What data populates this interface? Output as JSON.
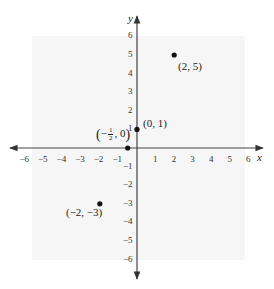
{
  "figure": {
    "x_axis_label": "x",
    "y_axis_label": "y",
    "x_ticks": [
      -6,
      -5,
      -4,
      -3,
      -2,
      -1,
      1,
      2,
      3,
      4,
      5,
      6
    ],
    "y_ticks": [
      6,
      5,
      4,
      3,
      2,
      1,
      -1,
      -2,
      -3,
      -4,
      -5,
      -6
    ],
    "colors": {
      "axis": "#444444",
      "point": "#111111",
      "background": "#ffffff"
    }
  },
  "points": [
    {
      "x": 2,
      "y": 5,
      "label": "(2, 5)"
    },
    {
      "x": 0,
      "y": 1,
      "label": "(0, 1)"
    },
    {
      "x": -0.5,
      "y": 0,
      "label": "(−½, 0)",
      "label_parts": {
        "open": "(",
        "sign": "−",
        "num": "1",
        "den": "2",
        "rest": ", 0",
        "close": ")"
      }
    },
    {
      "x": -2,
      "y": -3,
      "label": "(−2, −3)"
    }
  ],
  "chart_data": {
    "type": "scatter",
    "title": "",
    "xlabel": "x",
    "ylabel": "y",
    "xlim": [
      -6.5,
      6.5
    ],
    "ylim": [
      -6.5,
      6.5
    ],
    "grid": false,
    "x_tick_labels": [
      "-6",
      "-5",
      "-4",
      "-3",
      "-2",
      "-1",
      "1",
      "2",
      "3",
      "4",
      "5",
      "6"
    ],
    "y_tick_labels": [
      "6",
      "5",
      "4",
      "3",
      "2",
      "1",
      "-1",
      "-2",
      "-3",
      "-4",
      "-5",
      "-6"
    ],
    "series": [
      {
        "name": "points",
        "x": [
          2,
          0,
          -0.5,
          -2
        ],
        "y": [
          5,
          1,
          0,
          -3
        ],
        "labels": [
          "(2, 5)",
          "(0, 1)",
          "(−1/2, 0)",
          "(−2, −3)"
        ]
      }
    ]
  }
}
